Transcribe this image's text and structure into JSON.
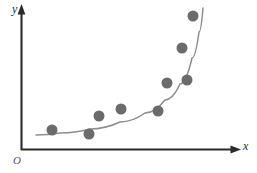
{
  "figure": {
    "axis_labels": {
      "y": "y",
      "x": "x",
      "origin": "O"
    },
    "colors": {
      "point": "#6b6b6b",
      "axis": "#2b2b2b",
      "curve": "#8d8d8d",
      "background": "#ffffff"
    }
  },
  "chart_data": {
    "type": "scatter",
    "title": "",
    "xlabel": "x",
    "ylabel": "y",
    "origin_label": "O",
    "grid": false,
    "legend": null,
    "axis_style": "arrow-axes-no-ticks",
    "xlim": [
      0,
      1
    ],
    "ylim": [
      0,
      1
    ],
    "points_px": [
      {
        "x": 52,
        "y": 130
      },
      {
        "x": 89,
        "y": 134
      },
      {
        "x": 99,
        "y": 116
      },
      {
        "x": 121,
        "y": 109
      },
      {
        "x": 158,
        "y": 111
      },
      {
        "x": 167,
        "y": 83
      },
      {
        "x": 187,
        "y": 80
      },
      {
        "x": 182,
        "y": 48
      },
      {
        "x": 193,
        "y": 16
      }
    ],
    "points_normalized": {
      "x": [
        0.143,
        0.313,
        0.359,
        0.461,
        0.631,
        0.673,
        0.765,
        0.742,
        0.793
      ],
      "y": [
        0.139,
        0.111,
        0.236,
        0.285,
        0.271,
        0.465,
        0.486,
        0.708,
        0.931
      ]
    },
    "fit_curve": {
      "kind": "exponential-trend",
      "points_px": [
        {
          "x": 36,
          "y": 135
        },
        {
          "x": 60,
          "y": 133
        },
        {
          "x": 90,
          "y": 129
        },
        {
          "x": 120,
          "y": 122
        },
        {
          "x": 145,
          "y": 113
        },
        {
          "x": 165,
          "y": 100
        },
        {
          "x": 180,
          "y": 84
        },
        {
          "x": 192,
          "y": 58
        },
        {
          "x": 199,
          "y": 32
        },
        {
          "x": 203,
          "y": 8
        }
      ]
    },
    "point_marker": {
      "shape": "circle",
      "diameter_px": 11,
      "color": "#6b6b6b"
    },
    "axes_px": {
      "origin": {
        "x": 21,
        "y": 150
      },
      "x_axis_end": {
        "x": 240,
        "y": 150
      },
      "y_axis_end": {
        "x": 21,
        "y": 6
      }
    }
  }
}
